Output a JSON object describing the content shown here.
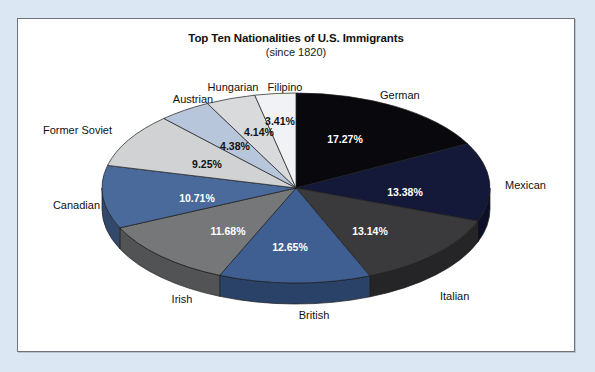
{
  "page": {
    "background_color": "#dbe8f4",
    "frame_background": "#ffffff",
    "frame_border_color": "#6f7478"
  },
  "chart_data": {
    "type": "pie",
    "title": "Top Ten Nationalities of U.S. Immigrants",
    "subtitle": "(since 1820)",
    "unit": "%",
    "start_angle_deg": 0,
    "direction": "clockwise",
    "three_d": true,
    "legend": "none",
    "labels_position": "outside",
    "values_position": "inside",
    "categories": [
      "German",
      "Mexican",
      "Italian",
      "British",
      "Irish",
      "Canadian",
      "Former Soviet",
      "Austrian",
      "Hungarian",
      "Filipino"
    ],
    "values": [
      17.27,
      13.38,
      13.14,
      12.65,
      11.68,
      10.71,
      9.25,
      4.38,
      4.14,
      3.41
    ],
    "value_labels": [
      "17.27%",
      "13.38%",
      "13.14%",
      "12.65%",
      "11.68%",
      "10.71%",
      "9.25%",
      "4.38%",
      "4.14%",
      "3.41%"
    ],
    "colors": [
      "#09080c",
      "#14193a",
      "#3a3a3c",
      "#3f5f93",
      "#757778",
      "#4a6a9c",
      "#d0d2d4",
      "#b8c6db",
      "#d8dadc",
      "#f0f2f5"
    ],
    "side_colors": [
      "#050508",
      "#0c1026",
      "#252527",
      "#2b4268",
      "#525354",
      "#33496c",
      "#9a9c9e",
      "#8696ab",
      "#a1a3a5",
      "#b9bcc0"
    ],
    "value_text_colors": [
      "#ffffff",
      "#ffffff",
      "#ffffff",
      "#ffffff",
      "#ffffff",
      "#ffffff",
      "#111111",
      "#111111",
      "#111111",
      "#111111"
    ]
  },
  "slice_geometry": [
    {
      "pct_x": 345,
      "pct_y": 140,
      "label_x": 380,
      "label_y": 96,
      "label_anchor": "start"
    },
    {
      "pct_x": 405,
      "pct_y": 193,
      "label_x": 505,
      "label_y": 186,
      "label_anchor": "start"
    },
    {
      "pct_x": 370,
      "pct_y": 232,
      "label_x": 440,
      "label_y": 297,
      "label_anchor": "start"
    },
    {
      "pct_x": 290,
      "pct_y": 248,
      "label_x": 314,
      "label_y": 316,
      "label_anchor": "middle"
    },
    {
      "pct_x": 228,
      "pct_y": 232,
      "label_x": 182,
      "label_y": 300,
      "label_anchor": "middle"
    },
    {
      "pct_x": 197,
      "pct_y": 199,
      "label_x": 100,
      "label_y": 206,
      "label_anchor": "end"
    },
    {
      "pct_x": 207,
      "pct_y": 165,
      "label_x": 112,
      "label_y": 131,
      "label_anchor": "end"
    },
    {
      "pct_x": 235,
      "pct_y": 147,
      "label_x": 193,
      "label_y": 100,
      "label_anchor": "middle"
    },
    {
      "pct_x": 259,
      "pct_y": 133,
      "label_x": 233,
      "label_y": 88,
      "label_anchor": "middle"
    },
    {
      "pct_x": 280,
      "pct_y": 122,
      "label_x": 285,
      "label_y": 88,
      "label_anchor": "middle"
    }
  ]
}
